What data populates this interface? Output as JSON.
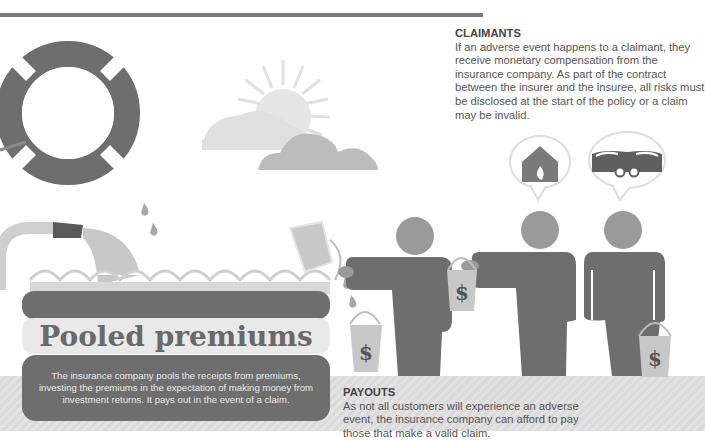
{
  "claimants": {
    "heading": "CLAIMANTS",
    "body": "If an adverse event happens to a claimant, they receive monetary compensation from the insurance company. As part of the contract between the insurer and the insuree, all risks must be disclosed at the start of the policy or a claim may be invalid."
  },
  "pool": {
    "title": "Pooled premiums",
    "description": "The insurance company pools the receipts from premiums, investing the premiums in the expectation of making money from investment returns. It pays out in the event of a claim."
  },
  "payouts": {
    "heading": "PAYOUTS",
    "body": "As not all customers will experience an adverse event, the insurance company can afford to pay those that make a valid claim."
  },
  "bucket_symbol": "$",
  "icons": [
    "life-ring-icon",
    "sun-icon",
    "cloud-icon",
    "hose-icon",
    "bucket-icon",
    "person-icon",
    "house-fire-icon",
    "car-crash-icon",
    "speech-bubble-icon",
    "water-drop-icon"
  ],
  "colors": {
    "dark": "#6e6e6e",
    "mid": "#9a9a9a",
    "light": "#d4d4d4",
    "pale": "#e9e9e9",
    "rule": "#7a7a7a"
  }
}
